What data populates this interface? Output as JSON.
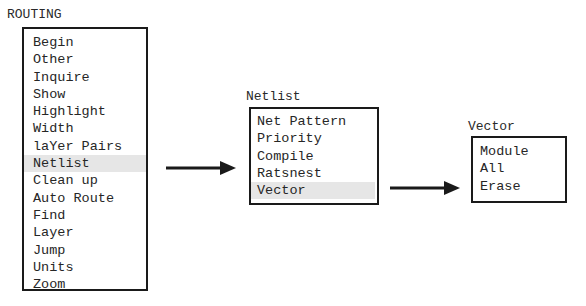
{
  "menus": {
    "routing": {
      "title": "ROUTING",
      "items": [
        {
          "label": "Begin"
        },
        {
          "label": "Other"
        },
        {
          "label": "Inquire"
        },
        {
          "label": "Show"
        },
        {
          "label": "Highlight"
        },
        {
          "label": "Width"
        },
        {
          "label": "laYer Pairs"
        },
        {
          "label": "Netlist",
          "selected": true
        },
        {
          "label": "Clean up"
        },
        {
          "label": "Auto Route"
        },
        {
          "label": "Find"
        },
        {
          "label": "Layer"
        },
        {
          "label": "Jump"
        },
        {
          "label": "Units"
        },
        {
          "label": "Zoom"
        }
      ]
    },
    "netlist": {
      "title": "Netlist",
      "items": [
        {
          "label": "Net Pattern"
        },
        {
          "label": "Priority"
        },
        {
          "label": "Compile"
        },
        {
          "label": "Ratsnest"
        },
        {
          "label": "Vector",
          "selected": true
        }
      ]
    },
    "vector": {
      "title": "Vector",
      "items": [
        {
          "label": "Module"
        },
        {
          "label": "All"
        },
        {
          "label": "Erase"
        }
      ]
    }
  },
  "arrows": [
    {
      "from": "routing.Netlist",
      "to": "netlist",
      "icon": "right-arrow-icon"
    },
    {
      "from": "netlist.Vector",
      "to": "vector",
      "icon": "right-arrow-icon"
    }
  ],
  "colors": {
    "border": "#1a1a1a",
    "text": "#262626",
    "selected_bg": "#e6e6e6",
    "background": "#ffffff"
  }
}
